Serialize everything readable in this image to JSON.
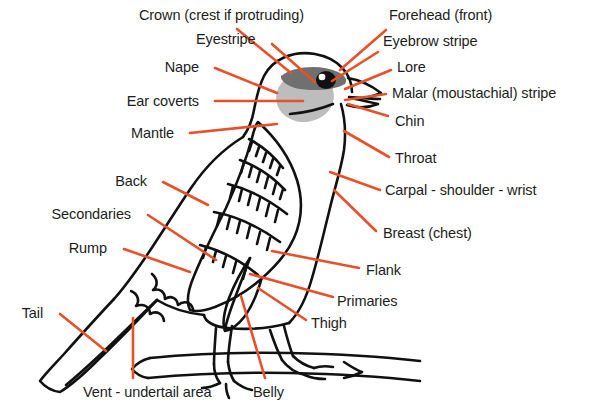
{
  "diagram": {
    "colors": {
      "background": "#ffffff",
      "outline": "#111111",
      "leader_line": "#e8502a",
      "label_text": "#1d1d1d",
      "ear_coverts_fill": "#b8b8b8",
      "eyestripe_fill": "#6e6e6e",
      "eye_fill": "#111111",
      "eye_highlight": "#ffffff"
    },
    "leader_line_width": 2.6,
    "outline_width": 2.6
  },
  "labels": [
    {
      "id": "crown",
      "text": "Crown (crest if protruding)",
      "x": 139,
      "y": 8,
      "align": "left"
    },
    {
      "id": "forehead",
      "text": "Forehead (front)",
      "x": 389,
      "y": 8,
      "align": "left"
    },
    {
      "id": "eyestripe",
      "text": "Eyestripe",
      "x": 196,
      "y": 32,
      "align": "left"
    },
    {
      "id": "eyebrow",
      "text": "Eyebrow stripe",
      "x": 383,
      "y": 34,
      "align": "left"
    },
    {
      "id": "nape",
      "text": "Nape",
      "x": 199,
      "y": 60,
      "align": "right"
    },
    {
      "id": "lore",
      "text": "Lore",
      "x": 397,
      "y": 60,
      "align": "left"
    },
    {
      "id": "ear-coverts",
      "text": "Ear coverts",
      "x": 199,
      "y": 94,
      "align": "right"
    },
    {
      "id": "malar",
      "text": "Malar (moustachial) stripe",
      "x": 392,
      "y": 86,
      "align": "left"
    },
    {
      "id": "mantle",
      "text": "Mantle",
      "x": 174,
      "y": 126,
      "align": "right"
    },
    {
      "id": "chin",
      "text": "Chin",
      "x": 395,
      "y": 114,
      "align": "left"
    },
    {
      "id": "throat",
      "text": "Throat",
      "x": 395,
      "y": 151,
      "align": "left"
    },
    {
      "id": "back",
      "text": "Back",
      "x": 147,
      "y": 174,
      "align": "right"
    },
    {
      "id": "carpal",
      "text": "Carpal - shoulder - wrist",
      "x": 385,
      "y": 183,
      "align": "left"
    },
    {
      "id": "secondaries",
      "text": "Secondaries",
      "x": 131,
      "y": 207,
      "align": "right"
    },
    {
      "id": "breast",
      "text": "Breast (chest)",
      "x": 383,
      "y": 226,
      "align": "left"
    },
    {
      "id": "rump",
      "text": "Rump",
      "x": 107,
      "y": 241,
      "align": "right"
    },
    {
      "id": "flank",
      "text": "Flank",
      "x": 366,
      "y": 263,
      "align": "left"
    },
    {
      "id": "primaries",
      "text": "Primaries",
      "x": 337,
      "y": 294,
      "align": "left"
    },
    {
      "id": "tail",
      "text": "Tail",
      "x": 43,
      "y": 306,
      "align": "right"
    },
    {
      "id": "thigh",
      "text": "Thigh",
      "x": 311,
      "y": 316,
      "align": "left"
    },
    {
      "id": "vent",
      "text": "Vent - undertail area",
      "x": 83,
      "y": 385,
      "align": "left"
    },
    {
      "id": "belly",
      "text": "Belly",
      "x": 253,
      "y": 385,
      "align": "left"
    }
  ],
  "leader_lines": [
    {
      "id": "crown",
      "x1": 237,
      "y1": 29,
      "x2": 291,
      "y2": 73
    },
    {
      "id": "eyestripe",
      "x1": 272,
      "y1": 44,
      "x2": 315,
      "y2": 82
    },
    {
      "id": "nape",
      "x1": 215,
      "y1": 68,
      "x2": 277,
      "y2": 93
    },
    {
      "id": "ear-coverts",
      "x1": 215,
      "y1": 101,
      "x2": 303,
      "y2": 101
    },
    {
      "id": "mantle",
      "x1": 190,
      "y1": 133,
      "x2": 277,
      "y2": 124
    },
    {
      "id": "back",
      "x1": 163,
      "y1": 182,
      "x2": 208,
      "y2": 205
    },
    {
      "id": "secondaries",
      "x1": 148,
      "y1": 215,
      "x2": 216,
      "y2": 260
    },
    {
      "id": "rump",
      "x1": 124,
      "y1": 249,
      "x2": 190,
      "y2": 272
    },
    {
      "id": "tail",
      "x1": 60,
      "y1": 314,
      "x2": 106,
      "y2": 351
    },
    {
      "id": "vent",
      "x1": 133,
      "y1": 318,
      "x2": 133,
      "y2": 378
    },
    {
      "id": "belly",
      "x1": 241,
      "y1": 296,
      "x2": 265,
      "y2": 378
    },
    {
      "id": "forehead",
      "x1": 386,
      "y1": 30,
      "x2": 340,
      "y2": 70
    },
    {
      "id": "eyebrow",
      "x1": 378,
      "y1": 52,
      "x2": 332,
      "y2": 81
    },
    {
      "id": "lore",
      "x1": 391,
      "y1": 70,
      "x2": 345,
      "y2": 89
    },
    {
      "id": "malar",
      "x1": 386,
      "y1": 94,
      "x2": 345,
      "y2": 100
    },
    {
      "id": "chin",
      "x1": 388,
      "y1": 116,
      "x2": 348,
      "y2": 104
    },
    {
      "id": "throat",
      "x1": 389,
      "y1": 157,
      "x2": 344,
      "y2": 131
    },
    {
      "id": "carpal",
      "x1": 380,
      "y1": 190,
      "x2": 330,
      "y2": 172
    },
    {
      "id": "breast",
      "x1": 376,
      "y1": 231,
      "x2": 334,
      "y2": 190
    },
    {
      "id": "flank",
      "x1": 359,
      "y1": 268,
      "x2": 272,
      "y2": 251
    },
    {
      "id": "primaries",
      "x1": 333,
      "y1": 297,
      "x2": 250,
      "y2": 274
    },
    {
      "id": "thigh",
      "x1": 306,
      "y1": 320,
      "x2": 258,
      "y2": 288
    }
  ],
  "bird_parts": [
    {
      "name": "head-crown-outline",
      "role": "outline"
    },
    {
      "name": "beak",
      "role": "outline"
    },
    {
      "name": "eye",
      "role": "filled-black"
    },
    {
      "name": "eye-highlight",
      "role": "filled-white"
    },
    {
      "name": "eyestripe-patch",
      "role": "filled-dark-gray"
    },
    {
      "name": "ear-coverts-patch",
      "role": "filled-light-gray"
    },
    {
      "name": "body-outline",
      "role": "outline"
    },
    {
      "name": "wing-coverts",
      "role": "feather-rows"
    },
    {
      "name": "wing-primaries",
      "role": "outline"
    },
    {
      "name": "tail",
      "role": "outline"
    },
    {
      "name": "undertail-coverts",
      "role": "feather-rows"
    },
    {
      "name": "leg-near",
      "role": "outline"
    },
    {
      "name": "leg-far",
      "role": "outline"
    },
    {
      "name": "foot-toes",
      "role": "outline"
    },
    {
      "name": "branch",
      "role": "outline"
    }
  ]
}
